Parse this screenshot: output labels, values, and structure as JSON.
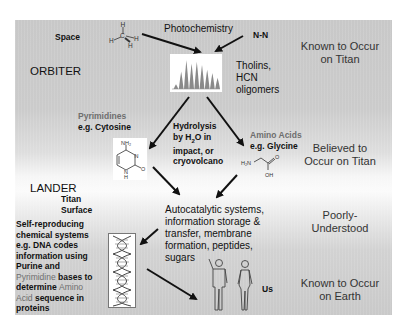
{
  "diagram": {
    "row_labels": {
      "orbiter": "ORBITER",
      "lander": "LANDER",
      "surface_line1": "Titan",
      "surface_line2": "Surface"
    },
    "nodes": {
      "space": "Space",
      "methane_atoms": {
        "c": "C",
        "h": "H"
      },
      "photochemistry": "Photochemistry",
      "nitrogen": "N-N",
      "tholins": [
        "Tholins,",
        "HCN",
        "oligomers"
      ],
      "pyrimidines": {
        "line1": "Pyrimidines",
        "line2": "e.g. Cytosine"
      },
      "cytosine_atoms": {
        "nh2": "NH₂",
        "n": "N",
        "nh": "N",
        "h": "H",
        "o": "O"
      },
      "hydrolysis": {
        "line1": "Hydrolysis",
        "line2_pre": "by H",
        "line2_sub": "2",
        "line2_post": "O in",
        "line3": "impact, or",
        "line4": "cryovolcano"
      },
      "amino_acids": {
        "line1": "Amino Acids",
        "line2_pre": "e.g. ",
        "line2_name": "Glycine"
      },
      "glycine_atoms": {
        "h2n": "H₂N",
        "o": "O",
        "oh": "OH"
      },
      "autocatalytic": [
        "Autocatalytic systems,",
        "information storage &",
        "transfer, membrane",
        "formation, peptides,",
        "sugars"
      ],
      "self_reproducing": [
        [
          {
            "t": "Self-reproducing",
            "gray": false
          }
        ],
        [
          {
            "t": "chemical systems",
            "gray": false
          }
        ],
        [
          {
            "t": "e.g. DNA codes",
            "gray": false
          }
        ],
        [
          {
            "t": "information using",
            "gray": false
          }
        ],
        [
          {
            "t": "Purine and",
            "gray": false
          }
        ],
        [
          {
            "t": "Pyrimidine",
            "gray": true
          },
          {
            "t": " bases to",
            "gray": false
          }
        ],
        [
          {
            "t": "determine ",
            "gray": false
          },
          {
            "t": "Amino",
            "gray": true
          }
        ],
        [
          {
            "t": "Acid",
            "gray": true
          },
          {
            "t": " sequence in",
            "gray": false
          }
        ],
        [
          {
            "t": "proteins",
            "gray": false
          }
        ]
      ],
      "us": "Us"
    },
    "status_column": [
      {
        "line1": "Known to Occur",
        "line2": "on Titan"
      },
      {
        "line1": "Believed to",
        "line2": "Occur on Titan"
      },
      {
        "line1": "Poorly-",
        "line2": "Understood"
      },
      {
        "line1": "Known to Occur",
        "line2": "on Earth"
      }
    ],
    "chromatogram_peaks": [
      0.15,
      0.55,
      0.9,
      0.8,
      0.85,
      0.75,
      0.6,
      0.5,
      0.35
    ],
    "colors": {
      "panel_gray": "#c9c9c9",
      "text": "#111111",
      "accent_gray_text": "#6e6e6e",
      "arrow": "#111111"
    }
  }
}
